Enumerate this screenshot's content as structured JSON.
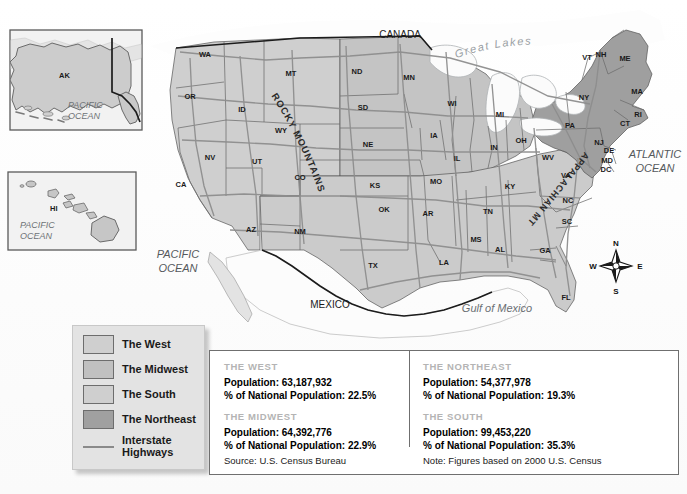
{
  "title": "The West Today",
  "map": {
    "insets": [
      {
        "name": "alaska",
        "state": "AK",
        "ocean": "PACIFIC OCEAN"
      },
      {
        "name": "hawaii",
        "state": "HI",
        "ocean": "PACIFIC OCEAN"
      }
    ],
    "geo_labels": [
      {
        "text": "CANADA",
        "x": 400,
        "y": 38,
        "size": 10,
        "color": "#1a1a1a",
        "style": "normal",
        "weight": "normal"
      },
      {
        "text": "MEXICO",
        "x": 330,
        "y": 308,
        "size": 10,
        "color": "#1a1a1a",
        "style": "normal",
        "weight": "normal"
      },
      {
        "text": "ATLANTIC",
        "x": 655,
        "y": 158,
        "size": 11,
        "color": "#55595c",
        "style": "italic",
        "weight": "normal"
      },
      {
        "text": "OCEAN",
        "x": 655,
        "y": 172,
        "size": 11,
        "color": "#55595c",
        "style": "italic",
        "weight": "normal"
      },
      {
        "text": "PACIFIC",
        "x": 178,
        "y": 258,
        "size": 11,
        "color": "#55595c",
        "style": "italic",
        "weight": "normal"
      },
      {
        "text": "OCEAN",
        "x": 178,
        "y": 272,
        "size": 11,
        "color": "#55595c",
        "style": "italic",
        "weight": "normal"
      },
      {
        "text": "Gulf of Mexico",
        "x": 497,
        "y": 312,
        "size": 11,
        "color": "#6b7074",
        "style": "italic",
        "weight": "normal"
      }
    ],
    "curved_labels": [
      {
        "text": "Great  Lakes",
        "name": "great-lakes-label"
      },
      {
        "text": "ROCKY MOUNTAINS",
        "name": "rocky-mountains-label"
      },
      {
        "text": "APPALACHIAN MTS.",
        "name": "appalachian-mountains-label"
      }
    ],
    "states": [
      {
        "abbr": "WA",
        "x": 205,
        "y": 57,
        "region": "west"
      },
      {
        "abbr": "OR",
        "x": 190,
        "y": 99,
        "region": "west"
      },
      {
        "abbr": "ID",
        "x": 242,
        "y": 112,
        "region": "west"
      },
      {
        "abbr": "MT",
        "x": 291,
        "y": 76,
        "region": "west"
      },
      {
        "abbr": "WY",
        "x": 281,
        "y": 133,
        "region": "west"
      },
      {
        "abbr": "NV",
        "x": 210,
        "y": 160,
        "region": "west"
      },
      {
        "abbr": "UT",
        "x": 257,
        "y": 164,
        "region": "west"
      },
      {
        "abbr": "CA",
        "x": 181,
        "y": 187,
        "region": "west"
      },
      {
        "abbr": "CO",
        "x": 300,
        "y": 180,
        "region": "west"
      },
      {
        "abbr": "AZ",
        "x": 251,
        "y": 232,
        "region": "west"
      },
      {
        "abbr": "NM",
        "x": 300,
        "y": 234,
        "region": "west"
      },
      {
        "abbr": "ND",
        "x": 357,
        "y": 74,
        "region": "midwest"
      },
      {
        "abbr": "SD",
        "x": 363,
        "y": 110,
        "region": "midwest"
      },
      {
        "abbr": "NE",
        "x": 368,
        "y": 147,
        "region": "midwest"
      },
      {
        "abbr": "KS",
        "x": 375,
        "y": 188,
        "region": "midwest"
      },
      {
        "abbr": "MN",
        "x": 409,
        "y": 80,
        "region": "midwest"
      },
      {
        "abbr": "IA",
        "x": 434,
        "y": 138,
        "region": "midwest"
      },
      {
        "abbr": "MO",
        "x": 436,
        "y": 184,
        "region": "midwest"
      },
      {
        "abbr": "WI",
        "x": 452,
        "y": 106,
        "region": "midwest"
      },
      {
        "abbr": "IL",
        "x": 457,
        "y": 161,
        "region": "midwest"
      },
      {
        "abbr": "IN",
        "x": 494,
        "y": 150,
        "region": "midwest"
      },
      {
        "abbr": "MI",
        "x": 500,
        "y": 117,
        "region": "midwest"
      },
      {
        "abbr": "OH",
        "x": 521,
        "y": 143,
        "region": "midwest"
      },
      {
        "abbr": "OK",
        "x": 384,
        "y": 212,
        "region": "south"
      },
      {
        "abbr": "TX",
        "x": 373,
        "y": 268,
        "region": "south"
      },
      {
        "abbr": "AR",
        "x": 428,
        "y": 216,
        "region": "south"
      },
      {
        "abbr": "LA",
        "x": 444,
        "y": 265,
        "region": "south"
      },
      {
        "abbr": "MS",
        "x": 476,
        "y": 242,
        "region": "south"
      },
      {
        "abbr": "AL",
        "x": 500,
        "y": 252,
        "region": "south"
      },
      {
        "abbr": "TN",
        "x": 488,
        "y": 214,
        "region": "south"
      },
      {
        "abbr": "KY",
        "x": 510,
        "y": 189,
        "region": "south"
      },
      {
        "abbr": "GA",
        "x": 545,
        "y": 253,
        "region": "south"
      },
      {
        "abbr": "FL",
        "x": 566,
        "y": 300,
        "region": "south"
      },
      {
        "abbr": "SC",
        "x": 567,
        "y": 224,
        "region": "south"
      },
      {
        "abbr": "NC",
        "x": 568,
        "y": 203,
        "region": "south"
      },
      {
        "abbr": "VA",
        "x": 566,
        "y": 178,
        "region": "south"
      },
      {
        "abbr": "WV",
        "x": 548,
        "y": 160,
        "region": "south"
      },
      {
        "abbr": "NY",
        "x": 584,
        "y": 100,
        "region": "northeast"
      },
      {
        "abbr": "PA",
        "x": 570,
        "y": 128,
        "region": "northeast"
      },
      {
        "abbr": "ME",
        "x": 625,
        "y": 61,
        "region": "northeast"
      },
      {
        "abbr": "NH",
        "x": 601,
        "y": 57,
        "region": "northeast"
      },
      {
        "abbr": "VT",
        "x": 587,
        "y": 60,
        "region": "northeast"
      },
      {
        "abbr": "MA",
        "x": 637,
        "y": 94,
        "region": "northeast"
      },
      {
        "abbr": "RI",
        "x": 638,
        "y": 117,
        "region": "northeast"
      },
      {
        "abbr": "CT",
        "x": 625,
        "y": 126,
        "region": "northeast"
      },
      {
        "abbr": "NJ",
        "x": 599,
        "y": 145,
        "region": "northeast"
      },
      {
        "abbr": "DE",
        "x": 609,
        "y": 153,
        "region": "northeast"
      },
      {
        "abbr": "MD",
        "x": 607,
        "y": 163,
        "region": "northeast"
      },
      {
        "abbr": "DC",
        "x": 606,
        "y": 172,
        "region": "northeast"
      }
    ],
    "compass": {
      "north": "N",
      "east": "E",
      "south": "S",
      "west": "W"
    }
  },
  "colors": {
    "west": "#cfcfcf",
    "midwest": "#c0c0c0",
    "south": "#cfcfcf",
    "northeast": "#a0a0a0",
    "water": "#fbfbfb",
    "border": "#4a4a4a",
    "highway": "#8a8a8a",
    "legend_bg": "#e3e3e3",
    "title": "#58585a",
    "stat_head": "#b4b4b4"
  },
  "legend": {
    "items": [
      {
        "label": "The West",
        "swatch": "#cfcfcf",
        "type": "swatch"
      },
      {
        "label": "The Midwest",
        "swatch": "#c0c0c0",
        "type": "swatch"
      },
      {
        "label": "The South",
        "swatch": "#cfcfcf",
        "type": "swatch"
      },
      {
        "label": "The Northeast",
        "swatch": "#a0a0a0",
        "type": "swatch"
      },
      {
        "label": "Interstate Highways",
        "label_line1": "Interstate",
        "label_line2": "Highways",
        "type": "line"
      }
    ]
  },
  "data_panel": {
    "blocks": [
      {
        "heading": "THE WEST",
        "population": "Population: 63,187,932",
        "percent": "% of National Population: 22.5%"
      },
      {
        "heading": "THE NORTHEAST",
        "population": "Population: 54,377,978",
        "percent": "% of National Population: 19.3%"
      },
      {
        "heading": "THE MIDWEST",
        "population": "Population: 64,392,776",
        "percent": "% of National Population: 22.9%"
      },
      {
        "heading": "THE SOUTH",
        "population": "Population: 99,453,220",
        "percent": "% of National Population: 35.3%"
      }
    ],
    "source": "Source: U.S. Census Bureau",
    "note": "Note: Figures based on 2000 U.S. Census"
  }
}
